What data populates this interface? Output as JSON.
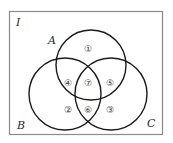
{
  "diagram": {
    "type": "venn",
    "universe_label": "I",
    "sets": [
      {
        "name": "A",
        "label": "A"
      },
      {
        "name": "B",
        "label": "B"
      },
      {
        "name": "C",
        "label": "C"
      }
    ],
    "regions": [
      {
        "id": 1,
        "glyph": "①",
        "description": "A only"
      },
      {
        "id": 2,
        "glyph": "②",
        "description": "B only"
      },
      {
        "id": 3,
        "glyph": "③",
        "description": "C only"
      },
      {
        "id": 4,
        "glyph": "④",
        "description": "A and B only"
      },
      {
        "id": 5,
        "glyph": "⑤",
        "description": "A and C only"
      },
      {
        "id": 6,
        "glyph": "⑥",
        "description": "B and C only"
      },
      {
        "id": 7,
        "glyph": "⑦",
        "description": "A and B and C"
      }
    ],
    "colors": {
      "stroke": "#1a1a1a",
      "frame": "#8a8a8a",
      "background": "#ffffff"
    }
  }
}
